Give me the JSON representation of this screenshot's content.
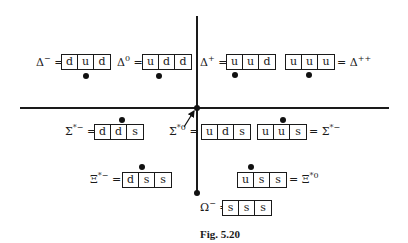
{
  "figure": {
    "caption": "Fig. 5.20"
  },
  "particles": [
    {
      "id": "delta-minus",
      "symbol": "Δ",
      "sup": "−",
      "label_side": "left",
      "quarks": [
        "d",
        "u",
        "d"
      ],
      "row": "delta"
    },
    {
      "id": "delta-zero",
      "symbol": "Δ",
      "sup": "0",
      "label_side": "left",
      "quarks": [
        "u",
        "d",
        "d"
      ],
      "row": "delta"
    },
    {
      "id": "delta-plus",
      "symbol": "Δ",
      "sup": "+",
      "label_side": "left",
      "quarks": [
        "u",
        "u",
        "d"
      ],
      "row": "delta"
    },
    {
      "id": "delta-plusplus",
      "symbol": "Δ",
      "sup": "++",
      "label_side": "right",
      "quarks": [
        "u",
        "u",
        "u"
      ],
      "row": "delta"
    },
    {
      "id": "sigma-star-minus",
      "symbol": "Σ",
      "sup": "*−",
      "label_side": "left",
      "quarks": [
        "d",
        "d",
        "s"
      ],
      "row": "sigma"
    },
    {
      "id": "sigma-star-zero",
      "symbol": "Σ",
      "sup": "*0",
      "label_side": "left",
      "quarks": [
        "u",
        "d",
        "s"
      ],
      "row": "sigma"
    },
    {
      "id": "sigma-star-right",
      "symbol": "Σ",
      "sup": "*−",
      "label_side": "right",
      "quarks": [
        "u",
        "u",
        "s"
      ],
      "row": "sigma"
    },
    {
      "id": "xi-star-minus",
      "symbol": "Ξ",
      "sup": "*−",
      "label_side": "left",
      "quarks": [
        "d",
        "s",
        "s"
      ],
      "row": "xi"
    },
    {
      "id": "xi-star-zero",
      "symbol": "Ξ",
      "sup": "*0",
      "label_side": "right",
      "quarks": [
        "u",
        "s",
        "s"
      ],
      "row": "xi"
    },
    {
      "id": "omega-minus",
      "symbol": "Ω",
      "sup": "−",
      "label_side": "left",
      "quarks": [
        "s",
        "s",
        "s"
      ],
      "row": "omega"
    }
  ],
  "equals": "=",
  "colors": {
    "ink": "#1a1a1a",
    "background": "#ffffff"
  }
}
